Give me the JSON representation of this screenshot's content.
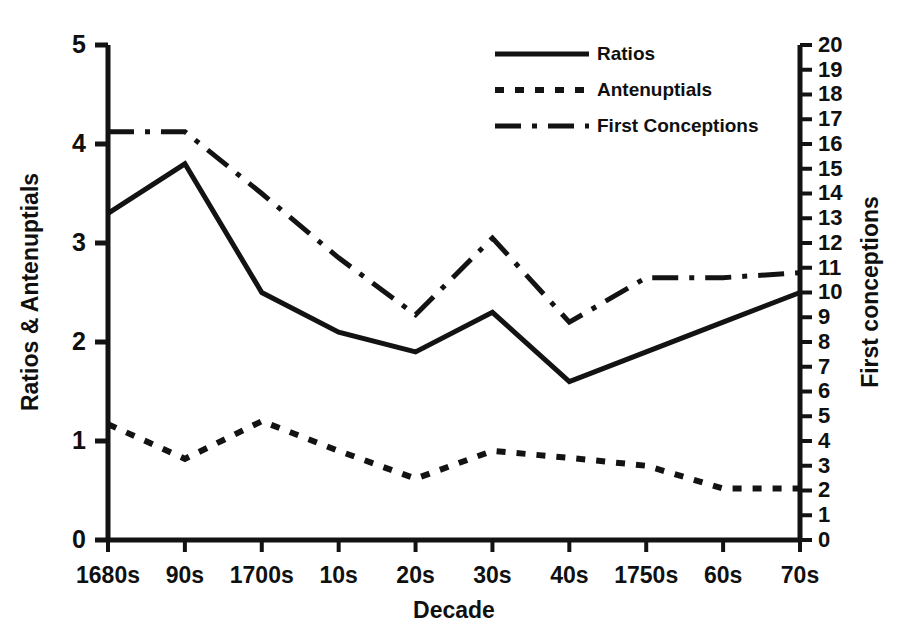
{
  "chart_data": {
    "type": "line",
    "title": "",
    "xlabel": "Decade",
    "ylabel": "Ratios & Antenuptials",
    "y2label": "First conceptions",
    "grid": false,
    "legend_position": "top-center",
    "categories": [
      "1680s",
      "90s",
      "1700s",
      "10s",
      "20s",
      "30s",
      "40s",
      "1750s",
      "60s",
      "70s"
    ],
    "ylim": [
      0,
      5
    ],
    "y2lim": [
      0,
      20
    ],
    "yticks": [
      "0",
      "1",
      "2",
      "3",
      "4",
      "5"
    ],
    "y2ticks": [
      "0",
      "1",
      "2",
      "3",
      "4",
      "5",
      "6",
      "7",
      "8",
      "9",
      "10",
      "11",
      "12",
      "13",
      "14",
      "15",
      "16",
      "17",
      "18",
      "19",
      "20"
    ],
    "series": [
      {
        "name": "Ratios",
        "axis": "left",
        "style": "solid",
        "values": [
          3.3,
          3.8,
          2.5,
          2.1,
          1.9,
          2.3,
          1.6,
          1.9,
          2.2,
          2.5
        ]
      },
      {
        "name": "Antenuptials",
        "axis": "left",
        "style": "dotted",
        "values": [
          1.17,
          0.82,
          1.2,
          0.9,
          0.62,
          0.9,
          0.83,
          0.75,
          0.52,
          0.52
        ]
      },
      {
        "name": "First Conceptions",
        "axis": "right",
        "style": "dashdot",
        "values": [
          16.5,
          16.5,
          14.0,
          11.4,
          9.1,
          12.2,
          8.8,
          10.6,
          10.6,
          10.8
        ]
      }
    ]
  },
  "legend": {
    "items": [
      {
        "label": "Ratios",
        "style": "solid"
      },
      {
        "label": "Antenuptials",
        "style": "dotted"
      },
      {
        "label": "First Conceptions",
        "style": "dashdot"
      }
    ]
  }
}
